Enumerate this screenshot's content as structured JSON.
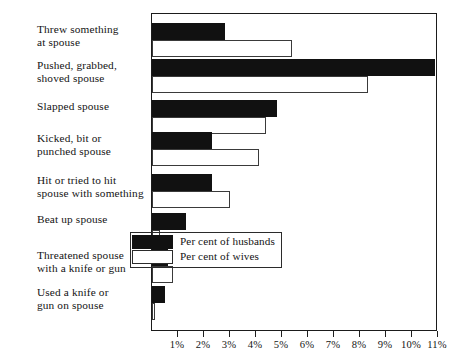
{
  "chart_data": {
    "type": "bar",
    "orientation": "horizontal",
    "title": "",
    "subtitle": "",
    "xlabel": "",
    "ylabel": "",
    "xlim": [
      0,
      11
    ],
    "grid": false,
    "legend_position": "inside-lower-right",
    "tick_labels": [
      "1%",
      "2%",
      "3%",
      "4%",
      "5%",
      "6%",
      "7%",
      "8%",
      "9%",
      "10%",
      "11%"
    ],
    "tick_values": [
      1,
      2,
      3,
      4,
      5,
      6,
      7,
      8,
      9,
      10,
      11
    ],
    "categories": [
      "Threw something\nat spouse",
      "Pushed, grabbed,\nshoved spouse",
      "Slapped spouse",
      "Kicked, bit or\npunched spouse",
      "Hit or tried to hit\nspouse with something",
      "Beat up spouse",
      "Threatened spouse\nwith a knife or gun",
      "Used a knife or\ngun on spouse"
    ],
    "series": [
      {
        "name": "Per cent of husbands",
        "color": "#111111",
        "values": [
          2.8,
          10.9,
          4.8,
          2.3,
          2.3,
          1.3,
          0.6,
          0.5
        ]
      },
      {
        "name": "Per cent of wives",
        "color": "#ffffff",
        "values": [
          5.4,
          8.3,
          4.4,
          4.1,
          3.0,
          0.3,
          0.8,
          0.1
        ]
      }
    ]
  },
  "legend": {
    "entries": [
      {
        "label": "Per cent of husbands",
        "swatch": "black-filled"
      },
      {
        "label": "Per cent of wives",
        "swatch": "white-outline"
      }
    ]
  },
  "axis": {
    "colors": {
      "line": "#1b1b1b",
      "text": "#151515"
    }
  }
}
